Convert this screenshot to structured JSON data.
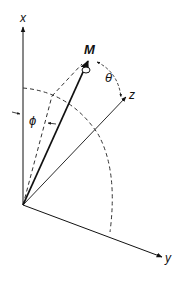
{
  "diagram": {
    "axes": {
      "x_label": "x",
      "y_label": "y",
      "z_label": "z"
    },
    "vector_label": "M",
    "angles": {
      "theta_label": "θ",
      "phi_label": "ϕ"
    },
    "colors": {
      "line": "#111111",
      "dashed": "#333333",
      "background": "#ffffff"
    }
  }
}
